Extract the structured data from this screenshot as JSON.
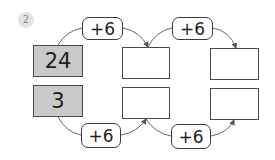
{
  "problem_number": "2",
  "rows": [
    {
      "start": "24",
      "steps": [
        {
          "operator": "+6",
          "answer": ""
        },
        {
          "operator": "+6",
          "answer": ""
        }
      ]
    },
    {
      "start": "3",
      "steps": [
        {
          "operator": "+6",
          "answer": ""
        },
        {
          "operator": "+6",
          "answer": ""
        }
      ]
    }
  ],
  "colors": {
    "given_box": "#c9c9c9",
    "line": "#555555"
  }
}
